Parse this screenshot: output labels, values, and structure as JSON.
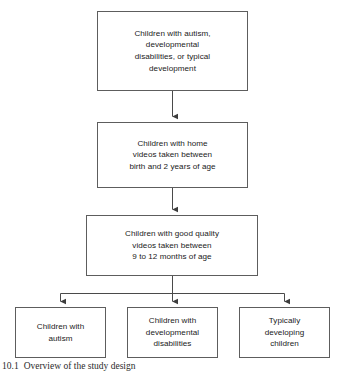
{
  "figure": {
    "type": "flowchart",
    "orientation": "top-to-bottom",
    "caption_number": "10.1",
    "caption_text": "Overview of the study design",
    "colors": {
      "box_border": "#5d5d5d",
      "box_fill": "#ffffff",
      "connector": "#4a4a4a",
      "text": "#1a1a1a",
      "background": "#ffffff"
    }
  },
  "nodes": {
    "cohort": {
      "label": "Children with autism,\ndevelopmental\ndisabilities, or typical\ndevelopment",
      "stage": 1
    },
    "home_videos": {
      "label": "Children with home\nvideos taken between\nbirth and 2 years of age",
      "stage": 2
    },
    "quality_videos": {
      "label": "Children with good quality\nvideos taken between\n9 to 12 months of age",
      "stage": 3
    },
    "outcome_autism": {
      "label": "Children with\nautism",
      "stage": 4
    },
    "outcome_developmental": {
      "label": "Children with\ndevelopmental\ndisabilities",
      "stage": 4
    },
    "outcome_typical": {
      "label": "Typically\ndeveloping\nchildren",
      "stage": 4
    }
  },
  "edges": [
    {
      "from": "cohort",
      "to": "home_videos",
      "style": "arrow-down"
    },
    {
      "from": "home_videos",
      "to": "quality_videos",
      "style": "arrow-down"
    },
    {
      "from": "quality_videos",
      "to": "outcome_autism",
      "style": "branch-arrow-down"
    },
    {
      "from": "quality_videos",
      "to": "outcome_developmental",
      "style": "branch-arrow-down"
    },
    {
      "from": "quality_videos",
      "to": "outcome_typical",
      "style": "branch-arrow-down"
    }
  ]
}
